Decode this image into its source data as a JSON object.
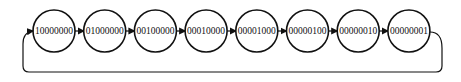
{
  "diagram": {
    "type": "ring-counter-state-diagram",
    "nodes": [
      {
        "label": "10000000"
      },
      {
        "label": "01000000"
      },
      {
        "label": "00100000"
      },
      {
        "label": "00010000"
      },
      {
        "label": "00001000"
      },
      {
        "label": "00000100"
      },
      {
        "label": "00000010"
      },
      {
        "label": "00000001"
      }
    ],
    "edges": [
      {
        "from": 0,
        "to": 1
      },
      {
        "from": 1,
        "to": 2
      },
      {
        "from": 2,
        "to": 3
      },
      {
        "from": 3,
        "to": 4
      },
      {
        "from": 4,
        "to": 5
      },
      {
        "from": 5,
        "to": 6
      },
      {
        "from": 6,
        "to": 7
      },
      {
        "from": 7,
        "to": 0,
        "style": "loop-back"
      }
    ],
    "colors": {
      "stroke": "#111111",
      "background": "#ffffff"
    }
  }
}
